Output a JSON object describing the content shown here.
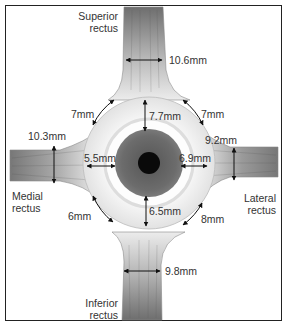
{
  "figure": {
    "muscles": {
      "superior": {
        "name_line1": "Superior",
        "name_line2": "rectus",
        "width": "10.6mm",
        "insertion_distance": "7.7mm"
      },
      "medial": {
        "name_line1": "Medial",
        "name_line2": "rectus",
        "width": "10.3mm",
        "insertion_distance": "5.5mm"
      },
      "lateral": {
        "name_line1": "Lateral",
        "name_line2": "rectus",
        "width": "9.2mm",
        "insertion_distance": "6.9mm"
      },
      "inferior": {
        "name_line1": "Inferior",
        "name_line2": "rectus",
        "width": "9.8mm",
        "insertion_distance": "6.5mm"
      }
    },
    "intermuscular_distances": {
      "superior_medial": "7mm",
      "superior_lateral": "7mm",
      "inferior_medial": "6mm",
      "inferior_lateral": "8mm"
    },
    "colors": {
      "muscle_dark": "#6e6e6e",
      "muscle_light": "#e4e4e4",
      "iris": "#6a6a6a",
      "pupil": "#0a0a0a",
      "sclera": "#f2f2f2",
      "limbus": "#d8d8d8",
      "text": "#333333"
    }
  }
}
